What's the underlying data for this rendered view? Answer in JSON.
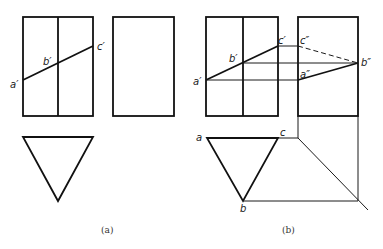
{
  "figure": {
    "panels": [
      {
        "id": "a",
        "caption": "(a)",
        "labels": {
          "a_prime": "a′",
          "b_prime": "b′",
          "c_prime": "c′"
        }
      },
      {
        "id": "b",
        "caption": "(b)",
        "labels": {
          "a_prime": "a′",
          "b_prime": "b′",
          "c_prime": "c′",
          "a_dprime": "a″",
          "b_dprime": "b″",
          "c_dprime": "c″",
          "a": "a",
          "b": "b",
          "c": "c"
        }
      }
    ],
    "colors": {
      "line": "#111111",
      "background": "#ffffff"
    }
  }
}
